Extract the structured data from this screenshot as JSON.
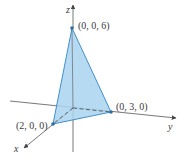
{
  "diagram": {
    "type": "3d-tetrahedron-plane",
    "axes": {
      "x": "x",
      "y": "y",
      "z": "z"
    },
    "points": [
      {
        "label": "(0, 0, 6)",
        "coords": [
          0,
          0,
          6
        ]
      },
      {
        "label": "(0, 3, 0)",
        "coords": [
          0,
          3,
          0
        ]
      },
      {
        "label": "(2, 0, 0)",
        "coords": [
          2,
          0,
          0
        ]
      }
    ],
    "colors": {
      "fill": "#a9d4ee",
      "edge": "#2f86c6",
      "axis": "#555555",
      "point": "#2a6fa8"
    }
  }
}
